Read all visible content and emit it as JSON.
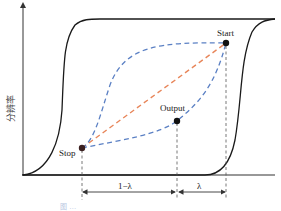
{
  "diagram": {
    "y_axis_label": "分辨率",
    "points": {
      "start": {
        "label": "Start"
      },
      "stop": {
        "label": "Stop"
      },
      "output": {
        "label": "Output"
      }
    },
    "dimensions": {
      "left_segment": "1−λ",
      "right_segment": "λ"
    },
    "colors": {
      "hysteresis_curve": "#1a1a1a",
      "straight_path": "#e8865a",
      "curved_paths": "#5b80c4",
      "points": "#111111",
      "guide_lines": "#555555"
    },
    "caption": "图 …"
  }
}
